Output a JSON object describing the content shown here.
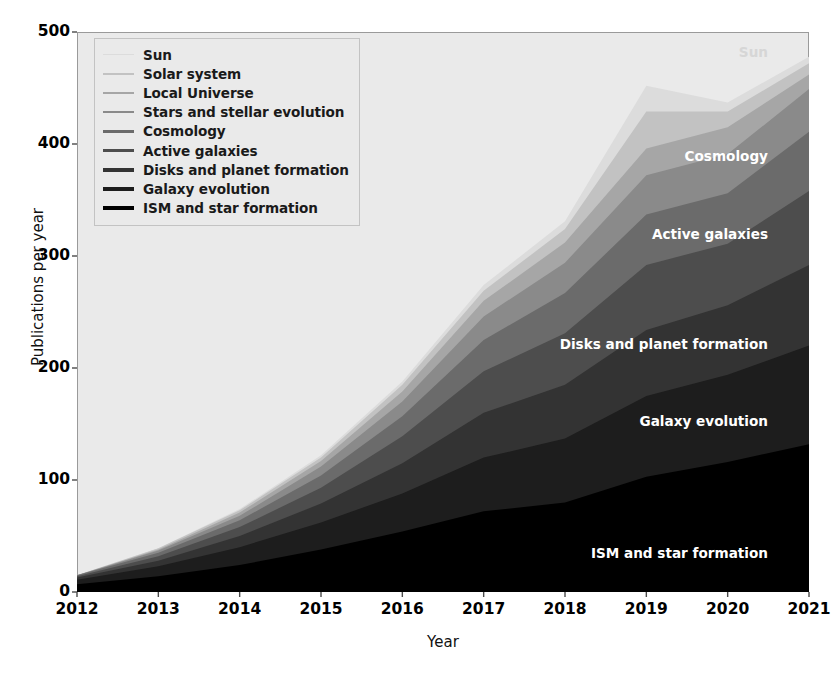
{
  "chart_data": {
    "type": "area",
    "stacked": true,
    "title": "",
    "xlabel": "Year",
    "ylabel": "Publications per year",
    "x": [
      2012,
      2013,
      2014,
      2015,
      2016,
      2017,
      2018,
      2019,
      2020,
      2021
    ],
    "xticklabels": [
      "2012",
      "2013",
      "2014",
      "2015",
      "2016",
      "2017",
      "2018",
      "2019",
      "2020",
      "2021"
    ],
    "yticklabels": [
      "0",
      "100",
      "200",
      "300",
      "400",
      "500"
    ],
    "yticks": [
      0,
      100,
      200,
      300,
      400,
      500
    ],
    "xlim": [
      2012,
      2021
    ],
    "ylim": [
      0,
      500
    ],
    "grid": false,
    "legend_position": "upper left",
    "series": [
      {
        "name": "ISM and star formation",
        "color": "#000000",
        "values": [
          7,
          14,
          24,
          38,
          54,
          72,
          80,
          103,
          116,
          132
        ]
      },
      {
        "name": "Galaxy evolution",
        "color": "#1d1d1d",
        "values": [
          4,
          9,
          16,
          24,
          34,
          48,
          57,
          72,
          78,
          88
        ]
      },
      {
        "name": "Disks and planet formation",
        "color": "#333333",
        "values": [
          2,
          5,
          10,
          17,
          27,
          40,
          48,
          59,
          62,
          72
        ]
      },
      {
        "name": "Active galaxies",
        "color": "#4d4d4d",
        "values": [
          1,
          4,
          8,
          14,
          24,
          37,
          46,
          58,
          55,
          66
        ]
      },
      {
        "name": "Cosmology",
        "color": "#6b6b6b",
        "values": [
          1,
          3,
          6,
          11,
          18,
          28,
          36,
          45,
          45,
          53
        ]
      },
      {
        "name": "Stars and stellar evolution",
        "color": "#8a8a8a",
        "values": [
          0,
          2,
          4,
          8,
          13,
          21,
          27,
          35,
          35,
          38
        ]
      },
      {
        "name": "Local Universe",
        "color": "#a6a6a6",
        "values": [
          0,
          1,
          3,
          5,
          9,
          14,
          18,
          24,
          24,
          13
        ]
      },
      {
        "name": "Solar system",
        "color": "#c2c2c2",
        "values": [
          0,
          1,
          2,
          3,
          6,
          9,
          12,
          33,
          14,
          10
        ]
      },
      {
        "name": "Sun",
        "color": "#dcdcdc",
        "values": [
          0,
          0,
          1,
          2,
          3,
          5,
          7,
          23,
          8,
          6
        ]
      }
    ],
    "legend_entries": [
      "Sun",
      "Solar system",
      "Local Universe",
      "Stars and stellar evolution",
      "Cosmology",
      "Active galaxies",
      "Disks and planet formation",
      "Galaxy evolution",
      "ISM and star formation"
    ],
    "annotations": [
      {
        "text": "Sun",
        "x": 768,
        "y": 44,
        "color": "#d6d6d6"
      },
      {
        "text": "Cosmology",
        "x": 768,
        "y": 148,
        "color": "#ffffff"
      },
      {
        "text": "Active galaxies",
        "x": 768,
        "y": 226,
        "color": "#ffffff"
      },
      {
        "text": "Disks and planet formation",
        "x": 768,
        "y": 336,
        "color": "#ffffff"
      },
      {
        "text": "Galaxy evolution",
        "x": 768,
        "y": 413,
        "color": "#ffffff"
      },
      {
        "text": "ISM and star formation",
        "x": 768,
        "y": 545,
        "color": "#ffffff"
      }
    ],
    "axes_facecolor": "#eaeaea",
    "figure_facecolor": "#ffffff"
  }
}
